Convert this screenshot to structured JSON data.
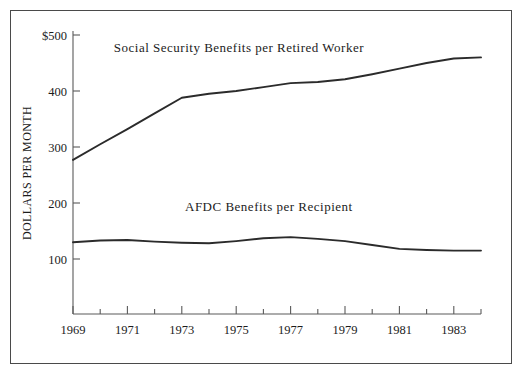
{
  "chart_data": {
    "type": "line",
    "title": "",
    "xlabel": "",
    "ylabel": "DOLLARS PER MONTH",
    "xlim": [
      1969,
      1984
    ],
    "ylim": [
      0,
      500
    ],
    "grid": false,
    "legend_position": "inline-annotation",
    "y_ticks": [
      100,
      200,
      300,
      400,
      500
    ],
    "y_tick_labels": [
      "100",
      "200",
      "300",
      "400",
      "$500"
    ],
    "x_ticks": [
      1969,
      1970,
      1971,
      1972,
      1973,
      1974,
      1975,
      1976,
      1977,
      1978,
      1979,
      1980,
      1981,
      1982,
      1983,
      1984
    ],
    "x_tick_labels_shown": [
      "1969",
      "1971",
      "1973",
      "1975",
      "1977",
      "1979",
      "1981",
      "1983"
    ],
    "x": [
      1969,
      1970,
      1971,
      1972,
      1973,
      1974,
      1975,
      1976,
      1977,
      1978,
      1979,
      1980,
      1981,
      1982,
      1983,
      1984
    ],
    "series": [
      {
        "name": "Social Security Benefits per Retired Worker",
        "label": "Social Security Benefits per Retired Worker",
        "color": "#2b2b2b",
        "values": [
          277,
          305,
          332,
          360,
          388,
          395,
          400,
          407,
          414,
          416,
          421,
          430,
          440,
          450,
          458,
          460
        ]
      },
      {
        "name": "AFDC Benefits per Recipient",
        "label": "AFDC Benefits per Recipient",
        "color": "#2b2b2b",
        "values": [
          130,
          133,
          134,
          131,
          129,
          128,
          132,
          137,
          139,
          136,
          132,
          125,
          118,
          116,
          115,
          115
        ]
      }
    ],
    "annotations": [
      {
        "text": "Social Security Benefits per Retired Worker",
        "x": 1975.1,
        "y": 470
      },
      {
        "text": "AFDC Benefits per Recipient",
        "x": 1976.2,
        "y": 185
      }
    ]
  },
  "colors": {
    "frame": "#4a4a4a",
    "axis": "#5a5a5a",
    "line": "#2b2b2b",
    "text": "#1c1c1c",
    "background": "#ffffff"
  }
}
